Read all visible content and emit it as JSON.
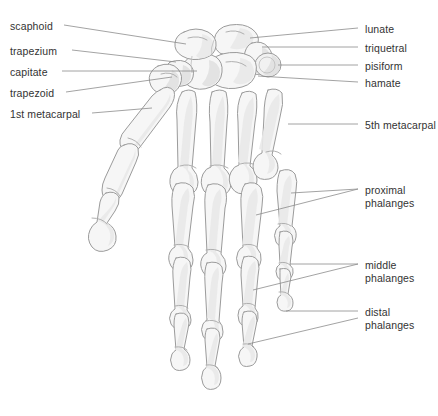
{
  "figure": {
    "background_color": "#ffffff",
    "bone_fill_color": "#f6f6f6",
    "bone_outline_color": "#9b9b9b",
    "label_text_color": "#333333",
    "leader_line_color": "#8c8c8c"
  },
  "labels_left": [
    {
      "text": "scaphoid",
      "x": 10,
      "y": 20
    },
    {
      "text": "trapezium",
      "x": 10,
      "y": 45
    },
    {
      "text": "capitate",
      "x": 10,
      "y": 66
    },
    {
      "text": "trapezoid",
      "x": 10,
      "y": 87
    },
    {
      "text": "1st metacarpal",
      "x": 10,
      "y": 108
    }
  ],
  "labels_right": [
    {
      "text": "lunate",
      "x": 365,
      "y": 23
    },
    {
      "text": "triquetral",
      "x": 365,
      "y": 42
    },
    {
      "text": "pisiform",
      "x": 365,
      "y": 60
    },
    {
      "text": "hamate",
      "x": 365,
      "y": 77
    },
    {
      "text": "5th metacarpal",
      "x": 365,
      "y": 119
    },
    {
      "text": "proximal\nphalanges",
      "x": 365,
      "y": 184
    },
    {
      "text": "middle\nphalanges",
      "x": 365,
      "y": 259
    },
    {
      "text": "distal\nphalanges",
      "x": 365,
      "y": 306
    }
  ],
  "leader_lines": [
    {
      "name": "scaphoid",
      "path": "M 64 25 L 186 44"
    },
    {
      "name": "trapezium",
      "path": "M 72 50 L 176 62"
    },
    {
      "name": "capitate",
      "path": "M 62 71 L 197 71"
    },
    {
      "name": "trapezoid",
      "path": "M 66 92 L 172 77"
    },
    {
      "name": "metacarpal-1",
      "path": "M 92 113 L 152 108"
    },
    {
      "name": "lunate",
      "path": "M 358 28 L 250 38"
    },
    {
      "name": "triquetral",
      "path": "M 358 47 L 262 47"
    },
    {
      "name": "pisiform",
      "path": "M 358 65 L 278 65"
    },
    {
      "name": "hamate",
      "path": "M 358 82 L 258 76"
    },
    {
      "name": "metacarpal-5",
      "path": "M 358 124 L 288 124"
    },
    {
      "name": "proximal-a",
      "path": "M 358 189 L 291 193"
    },
    {
      "name": "proximal-b",
      "path": "M 358 189 L 256 215"
    },
    {
      "name": "middle-a",
      "path": "M 358 264 L 290 264"
    },
    {
      "name": "middle-b",
      "path": "M 358 264 L 253 290"
    },
    {
      "name": "distal-a",
      "path": "M 358 311 L 286 311"
    },
    {
      "name": "distal-b",
      "path": "M 358 318 L 248 344"
    }
  ]
}
